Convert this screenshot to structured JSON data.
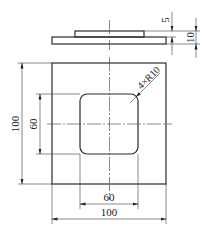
{
  "drawing": {
    "type": "engineering-drawing",
    "views": [
      "side-view",
      "front-view"
    ],
    "dimensions": {
      "boss_height": "5",
      "total_thickness": "10",
      "outer_height": "100",
      "inner_height": "60",
      "inner_width": "60",
      "outer_width": "100",
      "corner_radius": "4×R10"
    }
  }
}
